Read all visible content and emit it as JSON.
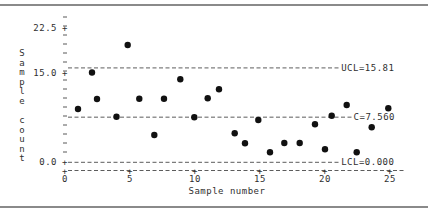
{
  "chart_data": {
    "type": "scatter",
    "title": "",
    "xlabel": "Sample number",
    "ylabel": "Sample count",
    "x_ticks": [
      "0",
      "5",
      "10",
      "15",
      "20",
      "25"
    ],
    "y_ticks": [
      "0.0",
      "15.0",
      "22.5"
    ],
    "xlim": [
      0,
      26
    ],
    "ylim": [
      -1,
      24
    ],
    "grid": false,
    "legend": null,
    "control_lines": [
      {
        "name": "UCL",
        "label": "UCL=15.81",
        "value": 15.81
      },
      {
        "name": "C",
        "label": "C=7.560",
        "value": 7.56
      },
      {
        "name": "LCL",
        "label": "LCL=0.000",
        "value": 0.0
      }
    ],
    "x": [
      1,
      2,
      3,
      4,
      5,
      6,
      7,
      8,
      9,
      10,
      11,
      12,
      13,
      14,
      15,
      16,
      17,
      18,
      19,
      20,
      21,
      22,
      23,
      24,
      25
    ],
    "values": [
      9,
      15,
      11,
      8,
      20,
      11,
      5,
      11,
      14,
      8,
      11,
      12,
      5,
      3,
      7,
      2,
      3,
      3,
      6,
      2,
      8,
      10,
      2,
      6,
      9
    ]
  },
  "render": {
    "points_px": [
      [
        78,
        109
      ],
      [
        92,
        72.5
      ],
      [
        97,
        99
      ],
      [
        116.5,
        116.7
      ],
      [
        127.7,
        45
      ],
      [
        139.3,
        98.7
      ],
      [
        154.3,
        135
      ],
      [
        164,
        98.7
      ],
      [
        180.3,
        79.3
      ],
      [
        194.3,
        117.3
      ],
      [
        207.7,
        98.3
      ],
      [
        219,
        89.3
      ],
      [
        234.7,
        133.3
      ],
      [
        245,
        143.3
      ],
      [
        258.3,
        120
      ],
      [
        270,
        152.3
      ],
      [
        284.3,
        143
      ],
      [
        299.7,
        143
      ],
      [
        315,
        124.3
      ],
      [
        325,
        149.3
      ],
      [
        331.7,
        115.7
      ],
      [
        346.7,
        105
      ],
      [
        356.7,
        152.3
      ],
      [
        371.7,
        127.3
      ],
      [
        388.3,
        108.3
      ]
    ],
    "colors": {
      "points": "#111111",
      "lines": "#4a4a4a",
      "text": "#2f2f2f",
      "frame": "#8a8a8a"
    }
  }
}
